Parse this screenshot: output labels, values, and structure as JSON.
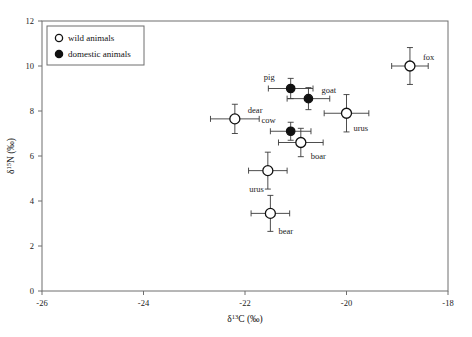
{
  "chart_data": {
    "type": "scatter",
    "title": "",
    "xlabel": "δ¹³C (‰)",
    "ylabel": "δ¹⁵N (‰)",
    "xlim": [
      -26,
      -18
    ],
    "ylim": [
      0,
      12
    ],
    "xticks": [
      -26,
      -24,
      -22,
      -20,
      -18
    ],
    "xtick_labels": [
      "-26",
      "-24",
      "-22",
      "-20",
      "-18"
    ],
    "yticks": [
      0,
      2,
      4,
      6,
      8,
      10,
      12
    ],
    "ytick_labels": [
      "0",
      "2",
      "4",
      "6",
      "8",
      "10",
      "12"
    ],
    "grid": false,
    "legend_position": "top-left",
    "legend": [
      {
        "label": "wild animals",
        "marker": "open-circle"
      },
      {
        "label": "domestic animals",
        "marker": "filled-circle"
      }
    ],
    "points": [
      {
        "name": "fox",
        "group": "wild",
        "x": -18.75,
        "y": 10.0,
        "xerr": 0.36,
        "yerr": 0.82,
        "label_dx": 13,
        "label_dy": -6
      },
      {
        "name": "pig",
        "group": "domestic",
        "x": -21.1,
        "y": 9.0,
        "xerr": 0.44,
        "yerr": 0.45,
        "label_dx": -16,
        "label_dy": -9
      },
      {
        "name": "goat",
        "group": "domestic",
        "x": -20.75,
        "y": 8.55,
        "xerr": 0.42,
        "yerr": 0.49,
        "label_dx": 13,
        "label_dy": -6
      },
      {
        "name": "dear",
        "group": "wild",
        "x": -22.2,
        "y": 7.65,
        "xerr": 0.48,
        "yerr": 0.65,
        "label_dx": 13,
        "label_dy": -6
      },
      {
        "name": "urus",
        "group": "wild",
        "x": -20.0,
        "y": 7.9,
        "xerr": 0.44,
        "yerr": 0.83,
        "label_dx": 7,
        "label_dy": 18
      },
      {
        "name": "cow",
        "group": "domestic",
        "x": -21.1,
        "y": 7.1,
        "xerr": 0.4,
        "yerr": 0.4,
        "label_dx": -15,
        "label_dy": -8
      },
      {
        "name": "boar",
        "group": "wild",
        "x": -20.9,
        "y": 6.6,
        "xerr": 0.44,
        "yerr": 0.63,
        "label_dx": 10,
        "label_dy": 16
      },
      {
        "name": "urus",
        "group": "wild",
        "x": -21.55,
        "y": 5.35,
        "xerr": 0.38,
        "yerr": 0.82,
        "label_dx": -4,
        "label_dy": 21
      },
      {
        "name": "bear",
        "group": "wild",
        "x": -21.5,
        "y": 3.45,
        "xerr": 0.38,
        "yerr": 0.8,
        "label_dx": 8,
        "label_dy": 21
      }
    ],
    "colors": {
      "frame": "#6e6e6e",
      "marker_stroke": "#111111",
      "wild_fill": "#ffffff",
      "domestic_fill": "#111111",
      "error_bar": "#3a3a3a",
      "background": "#ffffff"
    }
  }
}
